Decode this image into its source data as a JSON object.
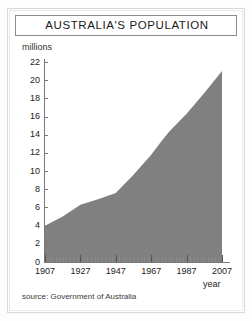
{
  "figure": {
    "title": "AUSTRALIA'S POPULATION",
    "source_note": "source: Government of Australia",
    "units_label": "millions",
    "xaxis_name": "year",
    "area_color": "#808080",
    "axis_color": "#777777",
    "frame_color": "#8c8c8c",
    "background": "#ffffff"
  },
  "chart_data": {
    "type": "area",
    "title": "AUSTRALIA'S POPULATION",
    "subtitle": "",
    "xlabel": "year",
    "ylabel": "millions",
    "xlim": [
      1907,
      2007
    ],
    "ylim": [
      0,
      22
    ],
    "xticks": [
      1907,
      1927,
      1947,
      1967,
      1987,
      2007
    ],
    "xtick_labels": [
      "1907",
      "1927",
      "1947",
      "1967",
      "1987",
      "2007"
    ],
    "yticks": [
      0,
      2,
      4,
      6,
      8,
      10,
      12,
      14,
      16,
      18,
      20,
      22
    ],
    "ytick_labels": [
      "0",
      "2",
      "4",
      "6",
      "8",
      "10",
      "12",
      "14",
      "16",
      "18",
      "20",
      "22"
    ],
    "grid": false,
    "legend": null,
    "annotations": [
      "source: Government of Australia"
    ],
    "series": [
      {
        "name": "Population",
        "color": "#808080",
        "x": [
          1907,
          1917,
          1927,
          1937,
          1947,
          1957,
          1967,
          1972,
          1977,
          1987,
          1997,
          2007
        ],
        "values": [
          4.0,
          5.0,
          6.3,
          6.9,
          7.6,
          9.6,
          11.8,
          13.1,
          14.3,
          16.3,
          18.6,
          21.0
        ]
      }
    ]
  }
}
